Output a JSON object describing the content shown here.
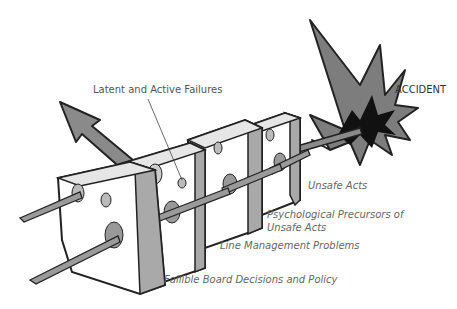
{
  "diagram": {
    "labels": {
      "latent_active": "Latent and Active Failures",
      "accident": "ACCIDENT",
      "unsafe_acts": "Unsafe Acts",
      "psych_line1": "Psychological Precursors of",
      "psych_line2": "Unsafe Acts",
      "line_mgmt": "Line Management Problems",
      "board": "Fallible Board Decisions and Policy"
    },
    "colors": {
      "outline": "#222222",
      "cheese_face": "#ffffff",
      "cheese_side": "#a9a9a9",
      "cheese_top": "#e6e6e6",
      "arrow": "#8a8a8a",
      "burst_outer": "#7d7d7d",
      "burst_inner": "#111111",
      "text": "#555555"
    },
    "layers": [
      {
        "name": "Fallible Board Decisions and Policy"
      },
      {
        "name": "Line Management Problems"
      },
      {
        "name": "Psychological Precursors of Unsafe Acts"
      },
      {
        "name": "Unsafe Acts"
      }
    ]
  }
}
